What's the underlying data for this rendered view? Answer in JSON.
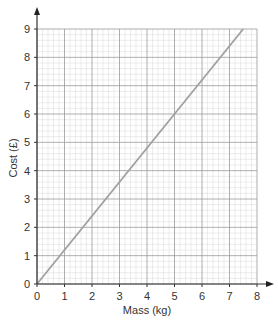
{
  "chart_data": {
    "type": "line",
    "title": "",
    "xlabel": "Mass (kg)",
    "ylabel": "Cost (£)",
    "xlim": [
      0,
      8
    ],
    "ylim": [
      0,
      9
    ],
    "xticks": [
      0,
      1,
      2,
      3,
      4,
      5,
      6,
      7,
      8
    ],
    "yticks": [
      0,
      1,
      2,
      3,
      4,
      5,
      6,
      7,
      8,
      9
    ],
    "grid": true,
    "minor_divisions": 5,
    "legend": null,
    "series": [
      {
        "name": "Cost",
        "x": [
          0,
          7.5
        ],
        "y": [
          0,
          9
        ],
        "color": "#a0a0a0"
      }
    ]
  },
  "colors": {
    "axis": "#333333",
    "major_grid": "#9a9a9a",
    "minor_grid": "#d8d8d8",
    "line": "#a0a0a0"
  }
}
